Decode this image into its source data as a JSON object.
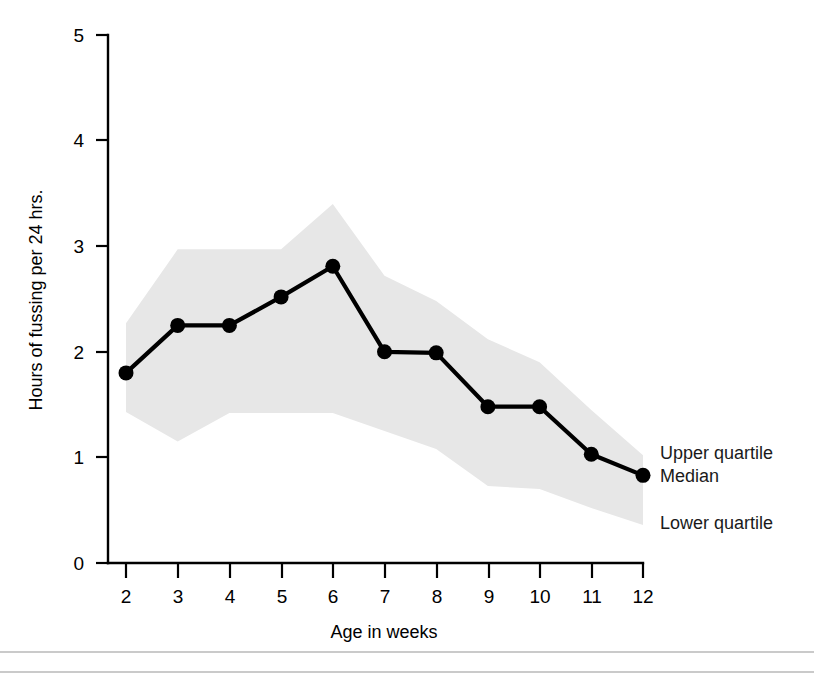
{
  "chart_data": {
    "type": "line",
    "title": "",
    "subtitle": "",
    "xlabel": "Age in weeks",
    "ylabel": "Hours of fussing per 24 hrs.",
    "x": [
      2,
      3,
      4,
      5,
      6,
      7,
      8,
      9,
      10,
      11,
      12
    ],
    "categories": [
      "2",
      "3",
      "4",
      "5",
      "6",
      "7",
      "8",
      "9",
      "10",
      "11",
      "12"
    ],
    "xlim": [
      2,
      12
    ],
    "ylim": [
      0,
      5
    ],
    "x_tick_labels": [
      "2",
      "3",
      "4",
      "5",
      "6",
      "7",
      "8",
      "9",
      "10",
      "11",
      "12"
    ],
    "y_tick_labels": [
      "0",
      "1",
      "2",
      "3",
      "4",
      "5"
    ],
    "y_ticks": [
      0,
      1,
      2,
      3,
      4,
      5
    ],
    "grid": false,
    "legend_position": "right-inline",
    "series": [
      {
        "name": "Median",
        "style": "line-with-markers",
        "color": "#000000",
        "values": [
          1.8,
          2.25,
          2.25,
          2.52,
          2.81,
          2.0,
          1.99,
          1.48,
          1.48,
          1.03,
          0.83
        ]
      },
      {
        "name": "Upper quartile",
        "style": "band-upper",
        "color": "#e7e7e7",
        "values": [
          2.27,
          2.97,
          2.97,
          2.97,
          3.4,
          2.72,
          2.48,
          2.12,
          1.9,
          1.45,
          1.02
        ]
      },
      {
        "name": "Lower quartile",
        "style": "band-lower",
        "color": "#e7e7e7",
        "values": [
          1.43,
          1.15,
          1.42,
          1.42,
          1.42,
          1.25,
          1.08,
          0.73,
          0.7,
          0.52,
          0.36
        ]
      }
    ],
    "band_fill_color": "#e7e7e7",
    "annotations": [
      {
        "text": "Upper quartile",
        "x": 12.1,
        "y": 1.15
      },
      {
        "text": "Median",
        "x": 12.1,
        "y": 0.92
      },
      {
        "text": "Lower quartile",
        "x": 12.1,
        "y": 0.47
      }
    ]
  },
  "legend": {
    "upper_quartile": "Upper quartile",
    "median": "Median",
    "lower_quartile": "Lower quartile"
  },
  "axes": {
    "x_title": "Age in weeks",
    "y_title": "Hours of fussing per 24 hrs.",
    "y_tick_0": "0",
    "y_tick_1": "1",
    "y_tick_2": "2",
    "y_tick_3": "3",
    "y_tick_4": "4",
    "y_tick_5": "5",
    "x_tick_2": "2",
    "x_tick_3": "3",
    "x_tick_4": "4",
    "x_tick_5": "5",
    "x_tick_6": "6",
    "x_tick_7": "7",
    "x_tick_8": "8",
    "x_tick_9": "9",
    "x_tick_10": "10",
    "x_tick_11": "11",
    "x_tick_12": "12"
  },
  "colors": {
    "line": "#000000",
    "band": "#e7e7e7",
    "axis": "#000000",
    "frame": "#b9b9b9",
    "background": "#ffffff"
  }
}
